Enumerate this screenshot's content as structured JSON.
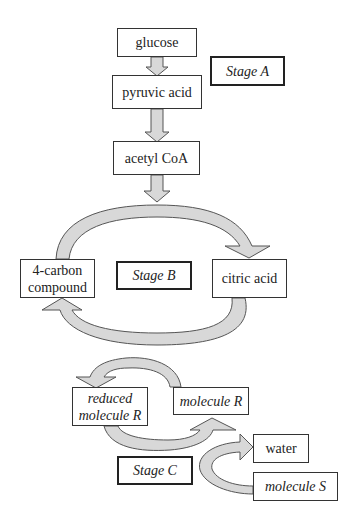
{
  "diagram": {
    "colors": {
      "arrow_fill": "#d8d8d8",
      "arrow_stroke": "#555555",
      "box_border": "#333333"
    },
    "nodes": {
      "glucose": "glucose",
      "pyruvic_acid": "pyruvic acid",
      "acetyl_coa": "acetyl CoA",
      "four_carbon_line1": "4-carbon",
      "four_carbon_line2": "compound",
      "citric_acid": "citric acid",
      "reduced_r_line1": "reduced",
      "reduced_r_line2": "molecule R",
      "molecule_r": "molecule R",
      "water": "water",
      "molecule_s": "molecule S"
    },
    "stages": {
      "a": "Stage A",
      "b": "Stage B",
      "c": "Stage C"
    },
    "edges": [
      {
        "from": "glucose",
        "to": "pyruvic acid"
      },
      {
        "from": "pyruvic acid",
        "to": "acetyl CoA"
      },
      {
        "from": "acetyl CoA",
        "to": "cycle"
      },
      {
        "from": "4-carbon compound",
        "to": "citric acid"
      },
      {
        "from": "citric acid",
        "to": "4-carbon compound"
      },
      {
        "from": "molecule R",
        "to": "reduced molecule R"
      },
      {
        "from": "reduced molecule R",
        "to": "molecule R"
      },
      {
        "from": "molecule S",
        "to": "water"
      }
    ]
  }
}
